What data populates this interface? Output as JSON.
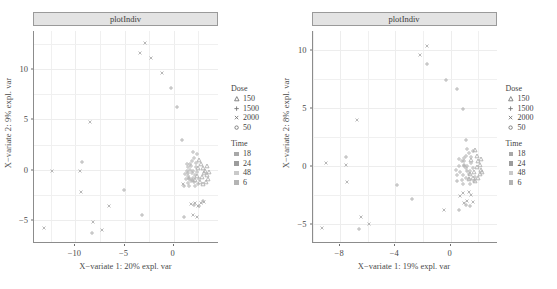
{
  "figure": {
    "width": 557,
    "height": 289,
    "background": "#ffffff",
    "panel_count": 2
  },
  "chart_data": [
    {
      "type": "scatter",
      "id": "left-panel",
      "title": "plotIndiv",
      "xlabel": "X−variate 1: 20% expl. var",
      "ylabel": "X−variate 2: 9% expl. var",
      "xlim": [
        -14.2,
        4.6
      ],
      "ylim": [
        -7.3,
        13.8
      ],
      "xticks": [
        -10,
        -5,
        0
      ],
      "xticklabels": [
        "−10",
        "−5",
        "0"
      ],
      "yticks": [
        10,
        5,
        0,
        -5
      ],
      "yticklabels": [
        "10",
        "5",
        "0",
        "−5"
      ],
      "grid": true,
      "legend_position": "right",
      "series": [
        {
          "name": "Dose 2000",
          "marker": "cross-x",
          "points": [
            [
              -13.2,
              -5.8
            ],
            [
              -12.4,
              -0.1
            ],
            [
              -9.5,
              -0.1
            ],
            [
              -9.4,
              -2.2
            ],
            [
              -8.5,
              4.7
            ],
            [
              -8.2,
              -5.2
            ],
            [
              -7.3,
              -6.0
            ],
            [
              -6.6,
              -3.6
            ],
            [
              -3.4,
              11.6
            ],
            [
              -2.9,
              12.6
            ],
            [
              -2.3,
              11.1
            ],
            [
              -1.2,
              9.6
            ],
            [
              0.9,
              -1.4
            ],
            [
              1.8,
              -3.4
            ],
            [
              2.2,
              -3.3
            ],
            [
              2.5,
              -3.6
            ],
            [
              2.8,
              -3.3
            ],
            [
              3.1,
              -3.2
            ],
            [
              2.0,
              -4.5
            ],
            [
              2.4,
              -4.7
            ]
          ]
        },
        {
          "name": "Dose 1500",
          "marker": "plus",
          "points": [
            [
              -9.3,
              0.8
            ],
            [
              -8.3,
              -6.3
            ],
            [
              -5.1,
              -2.0
            ],
            [
              -3.2,
              -4.5
            ],
            [
              -0.3,
              8.1
            ],
            [
              0.3,
              6.2
            ],
            [
              0.8,
              3.0
            ],
            [
              1.0,
              -1.6
            ],
            [
              1.0,
              -4.7
            ],
            [
              2.1,
              -3.5
            ],
            [
              2.6,
              -3.6
            ],
            [
              3.0,
              -3.1
            ],
            [
              1.4,
              -0.3
            ],
            [
              1.6,
              -0.8
            ],
            [
              1.9,
              -1.0
            ]
          ]
        },
        {
          "name": "Dose 150",
          "marker": "triangle",
          "points": [
            [
              2.6,
              1.0
            ],
            [
              2.8,
              0.6
            ],
            [
              3.0,
              0.2
            ],
            [
              3.2,
              -0.1
            ],
            [
              3.4,
              -0.5
            ],
            [
              3.5,
              -0.9
            ],
            [
              3.3,
              -1.2
            ],
            [
              3.0,
              -1.4
            ],
            [
              2.7,
              -1.2
            ],
            [
              2.9,
              -0.7
            ],
            [
              3.1,
              -0.3
            ],
            [
              2.5,
              0.2
            ],
            [
              3.6,
              -0.2
            ],
            [
              3.4,
              0.4
            ],
            [
              2.4,
              -0.6
            ],
            [
              2.2,
              -1.0
            ]
          ]
        },
        {
          "name": "Dose 50",
          "marker": "circle",
          "points": [
            [
              1.5,
              0.3
            ],
            [
              1.7,
              0.0
            ],
            [
              1.9,
              -0.3
            ],
            [
              1.4,
              -0.6
            ],
            [
              1.6,
              -0.9
            ],
            [
              1.8,
              -1.1
            ],
            [
              2.0,
              -0.8
            ],
            [
              2.2,
              -0.5
            ],
            [
              2.0,
              -0.1
            ],
            [
              1.3,
              -0.1
            ],
            [
              2.1,
              -1.2
            ],
            [
              1.5,
              -1.3
            ],
            [
              1.7,
              0.6
            ],
            [
              2.3,
              0.7
            ],
            [
              2.1,
              1.2
            ],
            [
              2.4,
              1.6
            ],
            [
              2.0,
              1.8
            ],
            [
              1.9,
              0.9
            ],
            [
              2.3,
              0.3
            ],
            [
              1.2,
              -0.9
            ],
            [
              2.5,
              -1.4
            ],
            [
              1.6,
              -1.6
            ],
            [
              2.2,
              -1.6
            ],
            [
              1.8,
              0.4
            ],
            [
              2.6,
              -0.9
            ],
            [
              1.3,
              0.6
            ],
            [
              2.4,
              -0.2
            ],
            [
              1.1,
              -0.4
            ]
          ]
        }
      ]
    },
    {
      "type": "scatter",
      "id": "right-panel",
      "title": "plotIndiv",
      "xlabel": "X−variate 1: 19% expl. var",
      "ylabel": "X−variate 2: 8% expl. var",
      "xlim": [
        -10.0,
        3.4
      ],
      "ylim": [
        -6.6,
        11.6
      ],
      "xticks": [
        -8,
        -4,
        0
      ],
      "xticklabels": [
        "−8",
        "−4",
        "0"
      ],
      "yticks": [
        10,
        5,
        0,
        -5
      ],
      "yticklabels": [
        "10",
        "5",
        "0",
        "−5"
      ],
      "grid": true,
      "legend_position": "right",
      "series": [
        {
          "name": "Dose 2000",
          "marker": "cross-x",
          "points": [
            [
              -9.3,
              -5.3
            ],
            [
              -9.0,
              0.3
            ],
            [
              -7.6,
              0.1
            ],
            [
              -7.5,
              -1.4
            ],
            [
              -6.8,
              4.0
            ],
            [
              -6.5,
              -4.4
            ],
            [
              -5.9,
              -5.0
            ],
            [
              -2.2,
              9.5
            ],
            [
              -1.7,
              10.3
            ],
            [
              -0.5,
              -3.8
            ],
            [
              0.9,
              -2.3
            ],
            [
              1.3,
              -2.2
            ],
            [
              1.5,
              -2.5
            ],
            [
              1.2,
              -3.0
            ],
            [
              1.6,
              -3.1
            ],
            [
              0.7,
              -2.6
            ],
            [
              1.0,
              -3.2
            ]
          ]
        },
        {
          "name": "Dose 1500",
          "marker": "plus",
          "points": [
            [
              -7.6,
              0.8
            ],
            [
              -6.6,
              -5.4
            ],
            [
              -3.9,
              -1.6
            ],
            [
              -2.8,
              -2.8
            ],
            [
              -1.7,
              8.8
            ],
            [
              -0.3,
              7.4
            ],
            [
              0.5,
              6.6
            ],
            [
              0.9,
              4.9
            ],
            [
              1.1,
              2.2
            ],
            [
              0.5,
              -1.3
            ],
            [
              0.6,
              -3.8
            ],
            [
              1.1,
              -3.3
            ],
            [
              1.4,
              -3.4
            ],
            [
              1.0,
              0.0
            ],
            [
              1.2,
              -0.4
            ]
          ]
        },
        {
          "name": "Dose 150",
          "marker": "triangle",
          "points": [
            [
              1.8,
              1.4
            ],
            [
              1.9,
              0.9
            ],
            [
              2.0,
              0.4
            ],
            [
              2.1,
              0.1
            ],
            [
              2.2,
              -0.3
            ],
            [
              2.1,
              -0.7
            ],
            [
              2.0,
              -1.0
            ],
            [
              1.8,
              -1.3
            ],
            [
              1.6,
              -1.0
            ],
            [
              1.7,
              -0.5
            ],
            [
              1.9,
              -0.1
            ],
            [
              1.5,
              0.5
            ],
            [
              2.3,
              -0.5
            ],
            [
              2.2,
              0.6
            ],
            [
              1.4,
              -0.7
            ],
            [
              1.3,
              -1.1
            ]
          ]
        },
        {
          "name": "Dose 50",
          "marker": "circle",
          "points": [
            [
              0.8,
              0.4
            ],
            [
              1.0,
              0.1
            ],
            [
              1.1,
              -0.2
            ],
            [
              0.7,
              -0.5
            ],
            [
              0.9,
              -0.8
            ],
            [
              1.1,
              -1.0
            ],
            [
              1.3,
              -0.7
            ],
            [
              1.4,
              -0.4
            ],
            [
              1.2,
              0.0
            ],
            [
              0.6,
              0.0
            ],
            [
              1.3,
              -1.1
            ],
            [
              0.8,
              -1.2
            ],
            [
              1.0,
              0.7
            ],
            [
              1.5,
              0.8
            ],
            [
              1.3,
              1.1
            ],
            [
              1.6,
              1.3
            ],
            [
              1.2,
              1.5
            ],
            [
              1.1,
              0.9
            ],
            [
              1.5,
              0.3
            ],
            [
              0.5,
              -0.8
            ],
            [
              1.7,
              -1.3
            ],
            [
              0.9,
              -1.5
            ],
            [
              1.4,
              -1.5
            ],
            [
              1.0,
              0.4
            ],
            [
              1.8,
              -0.9
            ],
            [
              0.6,
              0.6
            ],
            [
              1.6,
              -0.2
            ],
            [
              0.4,
              -0.3
            ]
          ]
        }
      ]
    }
  ],
  "legend": {
    "dose": {
      "title": "Dose",
      "items": [
        {
          "label": "150",
          "marker": "triangle"
        },
        {
          "label": "1500",
          "marker": "plus"
        },
        {
          "label": "2000",
          "marker": "cross-x"
        },
        {
          "label": "50",
          "marker": "circle"
        }
      ]
    },
    "time": {
      "title": "Time",
      "items": [
        {
          "label": "18",
          "color": "#a8a8a8"
        },
        {
          "label": "24",
          "color": "#9c9c9c"
        },
        {
          "label": "48",
          "color": "#c9c9c9"
        },
        {
          "label": "6",
          "color": "#b4b4b4"
        }
      ]
    }
  },
  "colors": {
    "marker": "#b0b0b0",
    "grid": "#f0f0f0",
    "axis": "#8c8c8c",
    "strip_fill": "#e3e3e3",
    "strip_border": "#9a9a9a",
    "text": "#4a4a4a",
    "background": "#ffffff"
  }
}
